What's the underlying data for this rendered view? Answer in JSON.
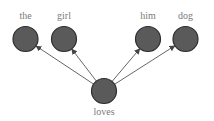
{
  "diagram": {
    "type": "dependency-tree",
    "colors": {
      "node_fill": "#5a5a5a",
      "node_stroke": "#2e2e2e",
      "edge": "#555555",
      "label": "#7a7a7a",
      "background": "#ffffff"
    },
    "root": {
      "id": "loves",
      "label": "loves",
      "cx": 104,
      "cy": 91,
      "r": 12.5,
      "label_y": 115
    },
    "nodes": [
      {
        "id": "the",
        "label": "the",
        "cx": 25.5,
        "cy": 39,
        "r": 12.5,
        "label_y": 19
      },
      {
        "id": "girl",
        "label": "girl",
        "cx": 64,
        "cy": 39,
        "r": 12.5,
        "label_y": 19
      },
      {
        "id": "him",
        "label": "him",
        "cx": 148,
        "cy": 39,
        "r": 12.5,
        "label_y": 19
      },
      {
        "id": "dog",
        "label": "dog",
        "cx": 185.5,
        "cy": 39,
        "r": 12.5,
        "label_y": 19
      }
    ],
    "edges": [
      {
        "from": "loves",
        "to": "the"
      },
      {
        "from": "loves",
        "to": "girl"
      },
      {
        "from": "loves",
        "to": "him"
      },
      {
        "from": "loves",
        "to": "dog"
      }
    ]
  }
}
